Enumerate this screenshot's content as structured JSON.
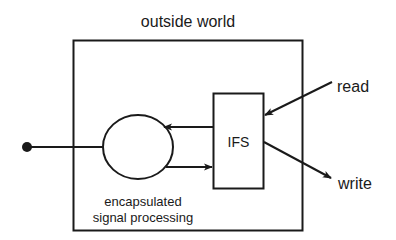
{
  "diagram": {
    "outer_label": "outside world",
    "inner_label_line1": "encapsulated",
    "inner_label_line2": "signal processing",
    "ifs_label": "IFS",
    "read_label": "read",
    "write_label": "write"
  },
  "colors": {
    "stroke": "#1a1a1a",
    "background": "#ffffff"
  }
}
